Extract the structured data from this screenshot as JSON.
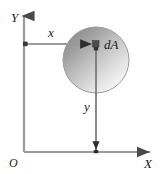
{
  "figure": {
    "background_color": "#ffffff"
  },
  "axes": {
    "vertical": {
      "label": "Y",
      "name": "y-axis",
      "color": "#8c8c8c",
      "arrow_direction": "up"
    },
    "horizontal": {
      "label": "X",
      "name": "x-axis",
      "color": "#8c8c8c",
      "arrow_direction": "right"
    },
    "origin": {
      "label": "O"
    }
  },
  "shape": {
    "name": "circle",
    "outline_color": "#9a9a9a",
    "fill_dark": "#8e8e8e",
    "fill_mid": "#c9c9c9",
    "fill_light": "#fbfbfb"
  },
  "element": {
    "label": "dA",
    "marker_color": "#3a3a3a"
  },
  "dimensions": {
    "horizontal": {
      "label": "x",
      "line_color": "#9a9a9a"
    },
    "vertical": {
      "label": "y",
      "line_color": "#6e6e6e"
    }
  }
}
